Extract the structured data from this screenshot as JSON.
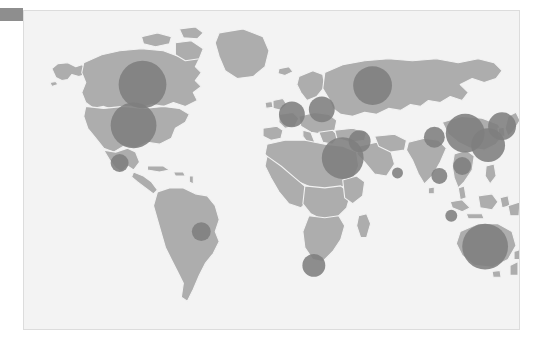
{
  "page": {
    "background_color": "#ffffff",
    "width": 537,
    "height": 345
  },
  "corner_tab": {
    "name": "corner-tab",
    "color": "#8e8e8e",
    "label": ""
  },
  "map": {
    "title": "",
    "frame_color": "#dcdcdc",
    "ocean_color": "#f3f3f3",
    "land_color": "#adadad",
    "border_color": "#f2f2f2",
    "bubble_color": "#7e7e7e"
  },
  "chart_data": {
    "type": "scatter",
    "title": "",
    "subtitle": "",
    "xlabel": "",
    "ylabel": "",
    "projection": "equirectangular",
    "grid": false,
    "legend": null,
    "annotations": [],
    "symbol": "circle",
    "encoding": "bubble size proportional to value",
    "xlim": [
      -180,
      180
    ],
    "ylim": [
      -90,
      90
    ],
    "points": [
      {
        "label": "Canada",
        "cx": 119,
        "cy": 74,
        "r": 24.0,
        "value": 24.0
      },
      {
        "label": "United States",
        "cx": 110,
        "cy": 115,
        "r": 23.0,
        "value": 23.0
      },
      {
        "label": "Mexico",
        "cx": 96,
        "cy": 153,
        "r": 9.0,
        "value": 9.0
      },
      {
        "label": "Brazil",
        "cx": 178,
        "cy": 222,
        "r": 9.5,
        "value": 9.5
      },
      {
        "label": "South Africa",
        "cx": 291,
        "cy": 256,
        "r": 11.5,
        "value": 11.5
      },
      {
        "label": "Nigeria / W Africa",
        "cx": 320,
        "cy": 148,
        "r": 21.0,
        "value": 21.0
      },
      {
        "label": "Western Europe",
        "cx": 269,
        "cy": 104,
        "r": 13.0,
        "value": 13.0
      },
      {
        "label": "Central Europe",
        "cx": 299,
        "cy": 99,
        "r": 13.0,
        "value": 13.0
      },
      {
        "label": "Russia",
        "cx": 350,
        "cy": 75,
        "r": 19.5,
        "value": 19.5
      },
      {
        "label": "Turkey / Mid-East",
        "cx": 337,
        "cy": 131,
        "r": 11.0,
        "value": 11.0
      },
      {
        "label": "Arabian Peninsula",
        "cx": 375,
        "cy": 163,
        "r": 5.5,
        "value": 5.5
      },
      {
        "label": "Pakistan",
        "cx": 412,
        "cy": 127,
        "r": 10.5,
        "value": 10.5
      },
      {
        "label": "India",
        "cx": 417,
        "cy": 166,
        "r": 8.0,
        "value": 8.0
      },
      {
        "label": "China",
        "cx": 443,
        "cy": 123,
        "r": 19.5,
        "value": 19.5
      },
      {
        "label": "East China",
        "cx": 466,
        "cy": 135,
        "r": 17.0,
        "value": 17.0
      },
      {
        "label": "Japan / Korea",
        "cx": 480,
        "cy": 116,
        "r": 14.0,
        "value": 14.0
      },
      {
        "label": "Southeast Asia",
        "cx": 440,
        "cy": 156,
        "r": 9.0,
        "value": 9.0
      },
      {
        "label": "Indonesia",
        "cx": 429,
        "cy": 206,
        "r": 6.0,
        "value": 6.0
      },
      {
        "label": "Australia",
        "cx": 463,
        "cy": 237,
        "r": 23.0,
        "value": 23.0
      }
    ]
  }
}
